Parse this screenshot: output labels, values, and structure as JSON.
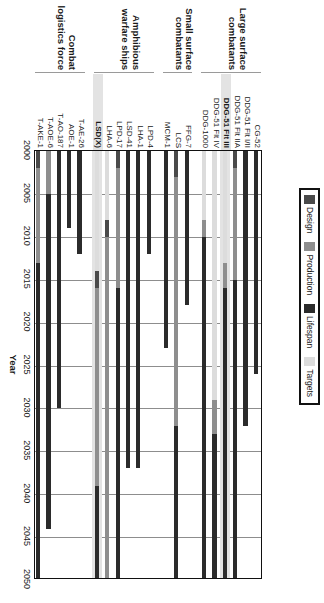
{
  "legend": {
    "items": [
      {
        "label": "Design",
        "color": "#4a4a4a"
      },
      {
        "label": "Production",
        "color": "#8e8e8e"
      },
      {
        "label": "Lifespan",
        "color": "#2b2b2b"
      },
      {
        "label": "Targets",
        "color": "#dcdcdc"
      }
    ]
  },
  "axis": {
    "title": "Year",
    "ticks": [
      "2000",
      "2005",
      "2010",
      "2015",
      "2020",
      "2025",
      "2030",
      "2035",
      "2040",
      "2045",
      "2050"
    ],
    "min": 2000,
    "max": 2050
  },
  "highlight_color": "#e3e3e3",
  "chart_data": {
    "type": "bar",
    "title": "",
    "xlabel": "Year",
    "ylabel": "",
    "xlim": [
      2000,
      2050
    ],
    "grid": true,
    "legend_position": "top-right",
    "orientation": "horizontal-gantt",
    "series": [
      {
        "name": "Design",
        "color": "#4a4a4a"
      },
      {
        "name": "Production",
        "color": "#8e8e8e"
      },
      {
        "name": "Lifespan",
        "color": "#2b2b2b"
      },
      {
        "name": "Targets",
        "color": "#dcdcdc"
      }
    ],
    "groups": [
      {
        "name": "Large surface combatants",
        "rows": [
          {
            "label": "CG-52",
            "highlight": false,
            "segments": [
              {
                "series": "Lifespan",
                "start": 2000,
                "end": 2026
              }
            ]
          },
          {
            "label": "DDG-51 Flt I/II",
            "highlight": false,
            "segments": [
              {
                "series": "Lifespan",
                "start": 2000,
                "end": 2032
              }
            ]
          },
          {
            "label": "DDG-51 Flt IIA",
            "highlight": false,
            "segments": [
              {
                "series": "Design",
                "start": 2000,
                "end": 2002
              },
              {
                "series": "Production",
                "start": 2002,
                "end": 2015
              },
              {
                "series": "Lifespan",
                "start": 2015,
                "end": 2050
              }
            ]
          },
          {
            "label": "DDG-51 Flt III",
            "highlight": true,
            "segments": [
              {
                "series": "Targets",
                "start": 2000,
                "end": 2013
              },
              {
                "series": "Production",
                "start": 2013,
                "end": 2016
              },
              {
                "series": "Lifespan",
                "start": 2016,
                "end": 2050
              }
            ]
          },
          {
            "label": "DDG-51 Flt IV",
            "highlight": false,
            "segments": [
              {
                "series": "Targets",
                "start": 2000,
                "end": 2029
              },
              {
                "series": "Production",
                "start": 2029,
                "end": 2033
              },
              {
                "series": "Lifespan",
                "start": 2033,
                "end": 2050
              }
            ]
          },
          {
            "label": "DDG-1000",
            "highlight": false,
            "segments": [
              {
                "series": "Targets",
                "start": 2000,
                "end": 2008
              },
              {
                "series": "Production",
                "start": 2008,
                "end": 2010
              },
              {
                "series": "Lifespan",
                "start": 2010,
                "end": 2050
              }
            ]
          }
        ]
      },
      {
        "name": "Small surface combatants",
        "rows": [
          {
            "label": "FFG-7",
            "highlight": false,
            "segments": [
              {
                "series": "Lifespan",
                "start": 2000,
                "end": 2018
              }
            ]
          },
          {
            "label": "LCS",
            "highlight": false,
            "segments": [
              {
                "series": "Design",
                "start": 2000,
                "end": 2003
              },
              {
                "series": "Production",
                "start": 2003,
                "end": 2032
              },
              {
                "series": "Lifespan",
                "start": 2032,
                "end": 2050
              }
            ]
          },
          {
            "label": "MCM-1",
            "highlight": false,
            "segments": [
              {
                "series": "Lifespan",
                "start": 2000,
                "end": 2023
              }
            ]
          }
        ]
      },
      {
        "name": "Amphibious warfare ships",
        "rows": [
          {
            "label": "LPD-4",
            "highlight": false,
            "segments": [
              {
                "series": "Lifespan",
                "start": 2000,
                "end": 2012
              }
            ]
          },
          {
            "label": "LHA-1",
            "highlight": false,
            "segments": [
              {
                "series": "Lifespan",
                "start": 2000,
                "end": 2037
              }
            ]
          },
          {
            "label": "LSD-41",
            "highlight": false,
            "segments": [
              {
                "series": "Lifespan",
                "start": 2000,
                "end": 2037
              }
            ]
          },
          {
            "label": "LPD-17",
            "highlight": false,
            "segments": [
              {
                "series": "Design",
                "start": 2000,
                "end": 2002
              },
              {
                "series": "Production",
                "start": 2002,
                "end": 2016
              },
              {
                "series": "Lifespan",
                "start": 2016,
                "end": 2050
              }
            ]
          },
          {
            "label": "LHA-6",
            "highlight": false,
            "segments": [
              {
                "series": "Targets",
                "start": 2000,
                "end": 2008
              },
              {
                "series": "Design",
                "start": 2008,
                "end": 2010
              },
              {
                "series": "Production",
                "start": 2010,
                "end": 2050
              }
            ]
          },
          {
            "label": "LSD(X)",
            "highlight": true,
            "segments": [
              {
                "series": "Targets",
                "start": 2000,
                "end": 2014
              },
              {
                "series": "Design",
                "start": 2014,
                "end": 2016
              },
              {
                "series": "Production",
                "start": 2016,
                "end": 2039
              },
              {
                "series": "Lifespan",
                "start": 2039,
                "end": 2050
              }
            ]
          }
        ]
      },
      {
        "name": "Combat logistics force",
        "rows": [
          {
            "label": "T-AE-26",
            "highlight": false,
            "segments": [
              {
                "series": "Lifespan",
                "start": 2000,
                "end": 2012
              }
            ]
          },
          {
            "label": "AOE-1",
            "highlight": false,
            "segments": [
              {
                "series": "Lifespan",
                "start": 2000,
                "end": 2009
              }
            ]
          },
          {
            "label": "T-AO-187",
            "highlight": false,
            "segments": [
              {
                "series": "Lifespan",
                "start": 2000,
                "end": 2030
              }
            ]
          },
          {
            "label": "T-AOE-6",
            "highlight": false,
            "segments": [
              {
                "series": "Production",
                "start": 2000,
                "end": 2005
              },
              {
                "series": "Lifespan",
                "start": 2005,
                "end": 2044
              }
            ]
          },
          {
            "label": "T-AKE-1",
            "highlight": false,
            "segments": [
              {
                "series": "Design",
                "start": 2000,
                "end": 2002
              },
              {
                "series": "Production",
                "start": 2002,
                "end": 2013
              },
              {
                "series": "Lifespan",
                "start": 2013,
                "end": 2050
              }
            ]
          }
        ]
      }
    ]
  }
}
